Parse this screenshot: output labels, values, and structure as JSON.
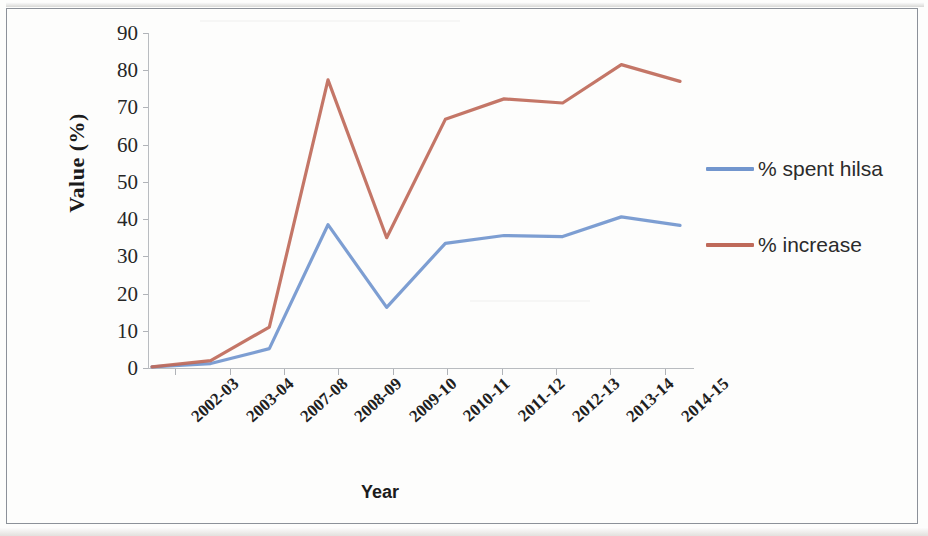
{
  "chart_data": {
    "type": "line",
    "title": "",
    "xlabel": "Year",
    "ylabel": "Value (%)",
    "categories": [
      "2002-03",
      "2003-04",
      "2007-08",
      "2008-09",
      "2009-10",
      "2010-11",
      "2011-12",
      "2012-13",
      "2013-14",
      "2014-15"
    ],
    "series": [
      {
        "name": "% spent hilsa",
        "color": "#7296ce",
        "values": [
          0.3,
          1.2,
          5.2,
          38.5,
          16.3,
          33.5,
          35.6,
          35.3,
          40.6,
          38.3
        ]
      },
      {
        "name": "% increase",
        "color": "#bf6a5a",
        "values": [
          0.3,
          2.0,
          11.0,
          77.4,
          35.0,
          66.8,
          72.3,
          71.2,
          81.5,
          77.0
        ]
      }
    ],
    "ylim": [
      0,
      90
    ],
    "y_ticks": [
      0,
      10,
      20,
      30,
      40,
      50,
      60,
      70,
      80,
      90
    ],
    "grid": false,
    "legend_position": "right"
  },
  "axes": {
    "y_title": "Value (%)",
    "x_title": "Year",
    "y_tick_labels": [
      "90",
      "80",
      "70",
      "60",
      "50",
      "40",
      "30",
      "20",
      "10",
      "0"
    ],
    "x_tick_labels": [
      "2002-03",
      "2003-04",
      "2007-08",
      "2008-09",
      "2009-10",
      "2010-11",
      "2011-12",
      "2012-13",
      "2013-14",
      "2014-15"
    ]
  },
  "legend": {
    "entries": [
      {
        "label": "%  spent hilsa",
        "color": "#7296ce"
      },
      {
        "label": "%  increase",
        "color": "#bf6a5a"
      }
    ]
  }
}
